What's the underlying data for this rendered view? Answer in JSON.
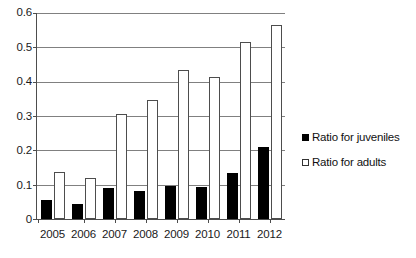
{
  "chart_data": {
    "type": "bar",
    "title": "",
    "subtitle": "",
    "xlabel": "",
    "ylabel": "",
    "categories": [
      "2005",
      "2006",
      "2007",
      "2008",
      "2009",
      "2010",
      "2011",
      "2012"
    ],
    "series": [
      {
        "name": "Ratio for juveniles",
        "color": "#000000",
        "style": "filled",
        "values": [
          0.055,
          0.045,
          0.09,
          0.082,
          0.095,
          0.093,
          0.135,
          0.21
        ]
      },
      {
        "name": "Ratio for adults",
        "color": "#ffffff",
        "style": "hollow",
        "values": [
          0.137,
          0.12,
          0.305,
          0.348,
          0.435,
          0.415,
          0.515,
          0.565
        ]
      }
    ],
    "ylim": [
      0,
      0.6
    ],
    "ytick_labels": [
      "0.6",
      "0.5",
      "0.4",
      "0.3",
      "0.2",
      "0.1",
      "0"
    ],
    "ytick_values": [
      0.6,
      0.5,
      0.4,
      0.3,
      0.2,
      0.1,
      0
    ],
    "grid": true,
    "grid_axis": "y",
    "legend_position": "right"
  },
  "legend": {
    "items": [
      {
        "label": "Ratio for juveniles",
        "style": "filled"
      },
      {
        "label": "Ratio for adults",
        "style": "hollow"
      }
    ]
  }
}
